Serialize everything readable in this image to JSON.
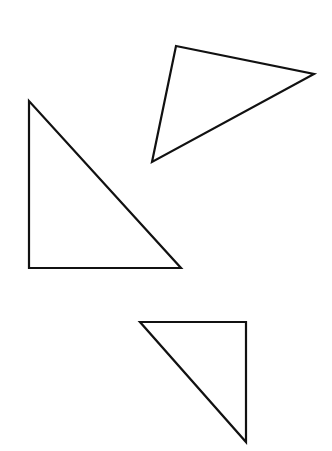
{
  "diagram": {
    "stroke_color": "#111111",
    "background": "#ffffff",
    "shapes": [
      {
        "name": "triangle-scalene",
        "points": "176,46 314,74 152,162"
      },
      {
        "name": "triangle-right-left",
        "points": "29,101 29,268 181,268"
      },
      {
        "name": "triangle-right-bottom",
        "points": "140,322 246,322 246,442"
      }
    ]
  }
}
